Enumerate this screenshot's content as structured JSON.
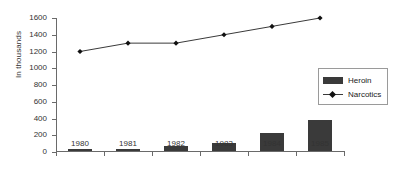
{
  "chart_data": {
    "type": "bar",
    "title": "",
    "subtitle": "",
    "xlabel": "",
    "ylabel": "In thousands",
    "categories": [
      "1980",
      "1981",
      "1982",
      "1983",
      "1984",
      "1985"
    ],
    "ylim": [
      0,
      1600
    ],
    "yticks": [
      0,
      200,
      400,
      600,
      800,
      1000,
      1200,
      1400,
      1600
    ],
    "grid": false,
    "legend_position": "right",
    "series": [
      {
        "name": "Heroin",
        "type": "bar",
        "color": "#3a3a3a",
        "values": [
          10,
          15,
          55,
          95,
          215,
          370
        ]
      },
      {
        "name": "Narcotics",
        "type": "line",
        "color": "#3a3a3a",
        "marker": "diamond",
        "values": [
          1200,
          1300,
          1300,
          1400,
          1500,
          1600
        ]
      }
    ]
  },
  "legend": {
    "entries": [
      {
        "label": "Heroin",
        "swatch": "bar-swatch-icon"
      },
      {
        "label": "Narcotics",
        "swatch": "line-marker-icon"
      }
    ]
  }
}
